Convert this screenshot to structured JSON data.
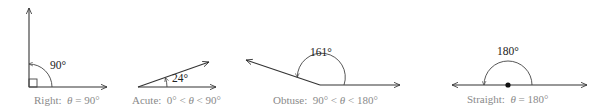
{
  "figure": {
    "colors": {
      "line": "#333333",
      "caption": "#8a8a8a",
      "label": "#222222"
    },
    "angles": [
      {
        "name": "right",
        "measure_label": "90°",
        "caption_prefix": "Right:  ",
        "caption_theta": "θ",
        "caption_suffix": " = 90°"
      },
      {
        "name": "acute",
        "measure_label": "24°",
        "caption_prefix": "Acute:  0° < ",
        "caption_theta": "θ",
        "caption_suffix": " < 90°"
      },
      {
        "name": "obtuse",
        "measure_label": "161°",
        "caption_prefix": "Obtuse:  90° < ",
        "caption_theta": "θ",
        "caption_suffix": " < 180°"
      },
      {
        "name": "straight",
        "measure_label": "180°",
        "caption_prefix": "Straight:  ",
        "caption_theta": "θ",
        "caption_suffix": " = 180°"
      }
    ]
  }
}
